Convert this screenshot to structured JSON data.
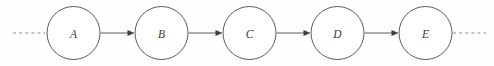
{
  "figure": {
    "background_color": "#fefefe",
    "stroke_color": "#4a4a4a",
    "dash_color": "#8d8d8d",
    "label_color": "#3a3a3a",
    "width": 494,
    "height": 66
  },
  "chart_data": {
    "type": "diagram",
    "subtype": "directed-chain",
    "xlabel": "",
    "ylabel": "",
    "orientation": "horizontal",
    "node_radius": 26.5,
    "node_spacing": 88,
    "baseline_y": 33,
    "nodes": [
      {
        "id": "A",
        "label": "A",
        "cx": 73.5,
        "cy": 33,
        "r": 26.5
      },
      {
        "id": "B",
        "label": "B",
        "cx": 161.5,
        "cy": 33,
        "r": 26.5
      },
      {
        "id": "C",
        "label": "C",
        "cx": 249.5,
        "cy": 33,
        "r": 26.5
      },
      {
        "id": "D",
        "label": "D",
        "cx": 337.5,
        "cy": 33,
        "r": 26.5
      },
      {
        "id": "E",
        "label": "E",
        "cx": 425.5,
        "cy": 33,
        "r": 26.5
      }
    ],
    "edges": [
      {
        "from": "A",
        "to": "B",
        "x1": 100.5,
        "x2": 134.5,
        "y": 33,
        "directed": true
      },
      {
        "from": "B",
        "to": "C",
        "x1": 188.5,
        "x2": 222.5,
        "y": 33,
        "directed": true
      },
      {
        "from": "C",
        "to": "D",
        "x1": 276.5,
        "x2": 310.5,
        "y": 33,
        "directed": true
      },
      {
        "from": "D",
        "to": "E",
        "x1": 364.5,
        "x2": 398.5,
        "y": 33,
        "directed": true
      }
    ],
    "continuations": [
      {
        "side": "left",
        "x1": 13,
        "x2": 45,
        "y": 33,
        "style": "dashed"
      },
      {
        "side": "right",
        "x1": 453,
        "x2": 486,
        "y": 33,
        "style": "dashed"
      }
    ],
    "legend": [],
    "annotations": []
  }
}
